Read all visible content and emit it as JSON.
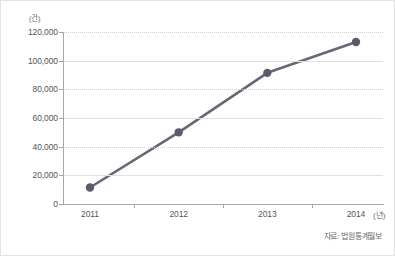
{
  "chart_data": {
    "type": "line",
    "title": "",
    "xlabel": "(년)",
    "ylabel": "(건)",
    "categories": [
      "2011",
      "2012",
      "2013",
      "2014"
    ],
    "x": [
      2011,
      2012,
      2013,
      2014
    ],
    "series": [
      {
        "name": "",
        "values": [
          11500,
          50000,
          91500,
          113000
        ]
      }
    ],
    "ylim": [
      0,
      120000
    ],
    "ytick_labels": [
      "0",
      "20,000",
      "40,000",
      "60,000",
      "80,000",
      "100,000",
      "120,000"
    ],
    "ytick_values": [
      0,
      20000,
      40000,
      60000,
      80000,
      100000,
      120000
    ],
    "grid": true,
    "legend": "none",
    "line_color": "#6b6575",
    "marker_color": "#5f5a69",
    "source_note": "자료: 법원통계월보"
  },
  "labels": {
    "y_unit": "(건)",
    "x_unit": "(년)",
    "source": "자료: 법원통계월보"
  }
}
